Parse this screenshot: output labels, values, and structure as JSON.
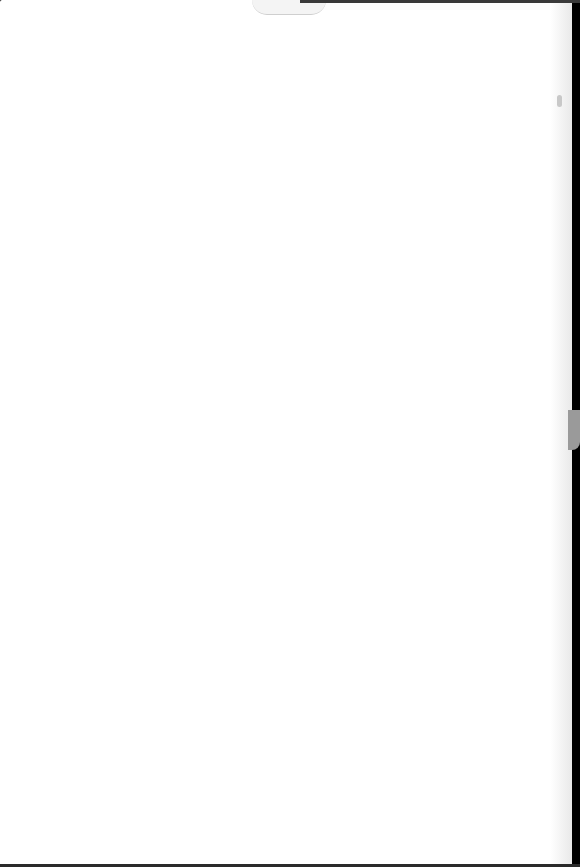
{
  "document": {
    "page_description": "blank scanned page",
    "bleed_through_text": "",
    "background_color": "#ffffff",
    "scan_border_color": "#000000"
  }
}
